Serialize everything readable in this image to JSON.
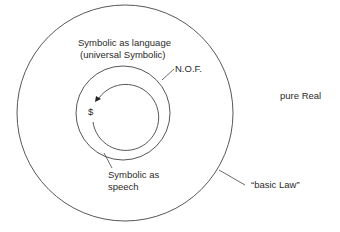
{
  "diagram": {
    "labels": {
      "language": "Symbolic as language",
      "universal": "(universal Symbolic)",
      "nof": "N.O.F.",
      "pure_real": "pure Real",
      "subject": "$",
      "speech_line1": "Symbolic as",
      "speech_line2": "speech",
      "basic_law": "“basic Law”"
    },
    "shapes": {
      "outer_circle": {
        "cx": 125,
        "cy": 113,
        "r": 108
      },
      "middle_circle": {
        "cx": 123,
        "cy": 113,
        "r": 47
      },
      "inner_arc": {
        "cx": 125,
        "cy": 116,
        "r": 33,
        "direction": "counterclockwise-arrow"
      }
    },
    "colors": {
      "stroke": "#444444",
      "text": "#2a2a2a"
    }
  }
}
